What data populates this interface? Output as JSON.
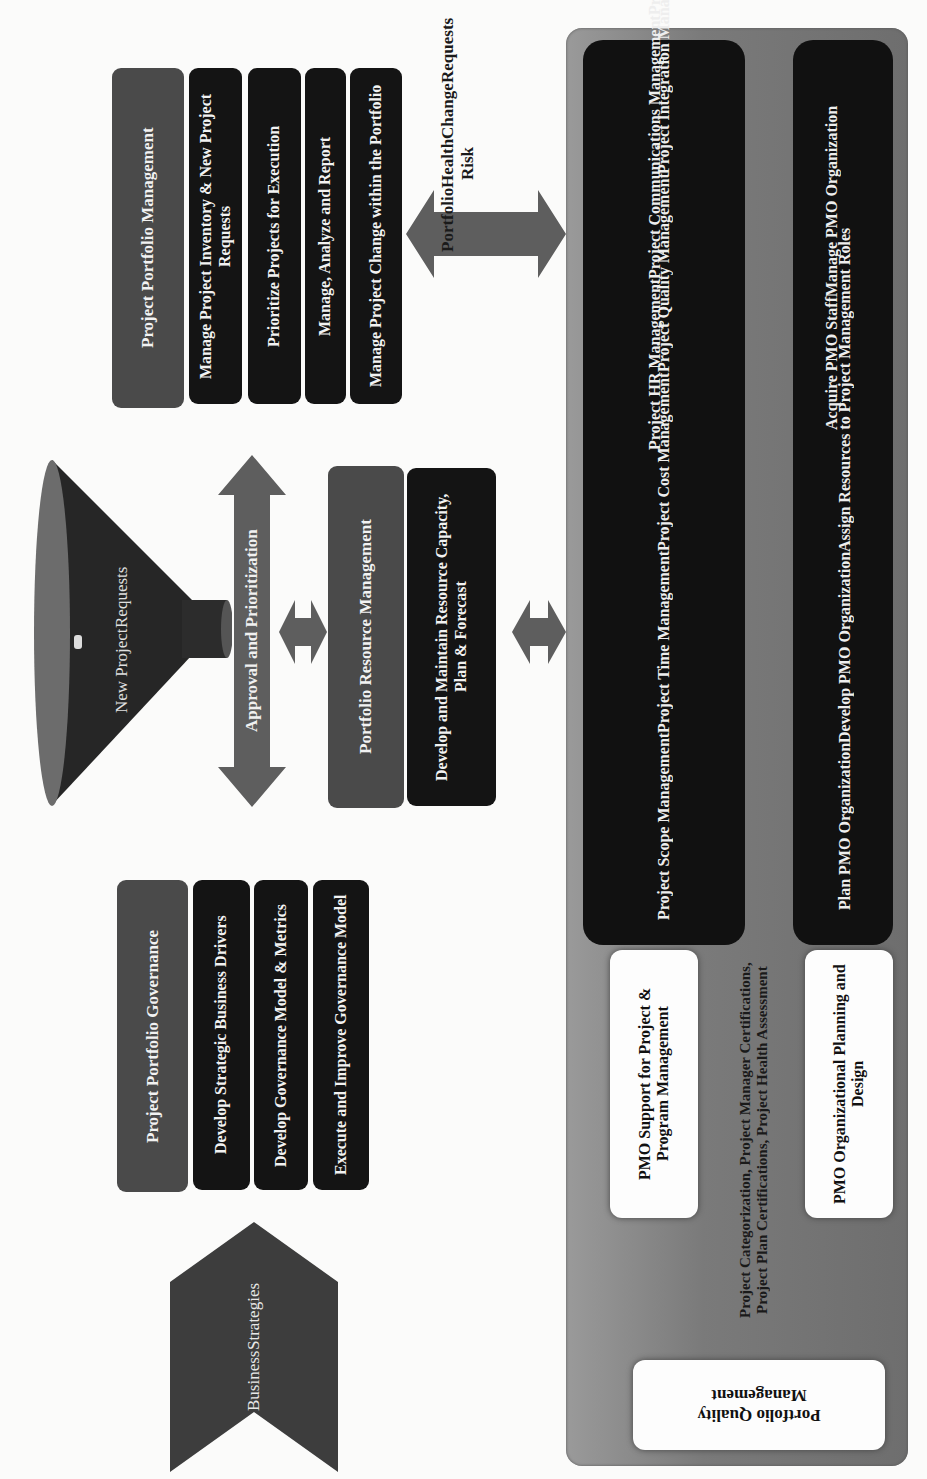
{
  "diagram": {
    "orientation": "rotated 90° counter-clockwise",
    "colors": {
      "header_box": "#4a4a4a",
      "item_box": "#141414",
      "arrow": "#5e5e5e",
      "panel": "#7a7a7a",
      "white_box": "#fdfdfd",
      "background": "#fbfbfa"
    },
    "business_strategies": {
      "label_line1": "Business",
      "label_line2": "Strategies"
    },
    "funnel": {
      "label_line1": "New Project",
      "label_line2": "Requests"
    },
    "approval_arrow": {
      "label": "Approval and Prioritization"
    },
    "portfolio_governance": {
      "header": "Project Portfolio Governance",
      "items": [
        "Develop Strategic Business Drivers",
        "Develop Governance Model & Metrics",
        "Execute and Improve Governance Model"
      ]
    },
    "portfolio_resource": {
      "header": "Portfolio Resource Management",
      "items": [
        "Develop and Maintain Resource Capacity, Plan & Forecast"
      ]
    },
    "portfolio_management": {
      "header": "Project Portfolio Management",
      "items": [
        "Manage Project Inventory & New Project Requests",
        "Prioritize Projects for Execution",
        "Manage, Analyze and Report",
        "Manage Project Change within the Portfolio"
      ]
    },
    "health_arrow": {
      "label_lines": [
        "Portfolio",
        "Health Risk",
        "Change",
        "Requests"
      ]
    },
    "pmo_panel": {
      "project_mgmt_list_left": [
        "Project Scope Management",
        "Project Time Management",
        "Project Cost Management",
        "Project Quality Management",
        "Project Integration Management"
      ],
      "project_mgmt_list_right": [
        "Project HR Management",
        "Project Communications Management",
        "Project RAID Management",
        "Project Procurement Management"
      ],
      "org_list_left": [
        "Plan PMO Organization",
        "Develop PMO Organization",
        "Assign Resources to Project Management Roles"
      ],
      "org_list_right": [
        "Acquire PMO Staff",
        "Manage PMO Organization"
      ],
      "pmo_support_label": "PMO Support for Project & Program Management",
      "assessment_text": "Project Categorization, Project Manager Certifications, Project Plan Certifications, Project Health Assessment",
      "pmo_org_label": "PMO Organizational Planning and Design",
      "quality_label": "Portfolio Quality Management"
    }
  }
}
